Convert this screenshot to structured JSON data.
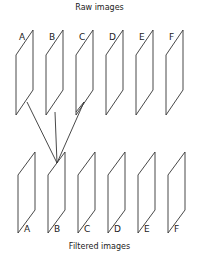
{
  "diagram": {
    "top_title": "Raw images",
    "bottom_title": "Filtered images",
    "raw_labels": [
      "A",
      "B",
      "C",
      "D",
      "E",
      "F"
    ],
    "filtered_labels": [
      "A",
      "B",
      "C",
      "D",
      "E",
      "F"
    ],
    "connections": [
      {
        "from": "raw.A",
        "to": "filtered.B"
      },
      {
        "from": "raw.B",
        "to": "filtered.B"
      },
      {
        "from": "raw.C",
        "to": "filtered.B"
      }
    ],
    "line_color": "#333333"
  }
}
